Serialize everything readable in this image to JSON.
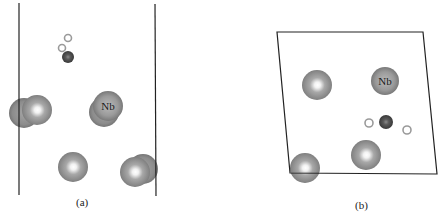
{
  "figure": {
    "panels": [
      {
        "id": "a",
        "caption": "(a)",
        "view": "side view",
        "cell_lines": [
          {
            "x1": 19,
            "y1": 3,
            "x2": 19,
            "y2": 195
          },
          {
            "x1": 155,
            "y1": 4,
            "x2": 156,
            "y2": 196
          }
        ],
        "atoms": [
          {
            "type": "large",
            "cx": 24,
            "cy": 113,
            "r": 15
          },
          {
            "type": "large",
            "cx": 37,
            "cy": 110,
            "r": 15
          },
          {
            "type": "large",
            "cx": 104,
            "cy": 112,
            "r": 15
          },
          {
            "type": "large",
            "cx": 108,
            "cy": 106,
            "r": 15,
            "label": "Nb"
          },
          {
            "type": "large",
            "cx": 73,
            "cy": 167,
            "r": 15
          },
          {
            "type": "large",
            "cx": 143,
            "cy": 169,
            "r": 15
          },
          {
            "type": "large",
            "cx": 135,
            "cy": 172,
            "r": 15
          },
          {
            "type": "small-dark",
            "cx": 68,
            "cy": 57,
            "r": 6
          },
          {
            "type": "small-ring",
            "cx": 68,
            "cy": 38,
            "r": 3.5
          },
          {
            "type": "small-ring",
            "cx": 62,
            "cy": 48,
            "r": 3.5
          }
        ]
      },
      {
        "id": "b",
        "caption": "(b)",
        "view": "top view",
        "cell_polygon": "277,32 423,32 437,174 290,173",
        "atoms": [
          {
            "type": "large",
            "cx": 317,
            "cy": 85,
            "r": 15
          },
          {
            "type": "large",
            "cx": 385,
            "cy": 81,
            "r": 14,
            "label": "Nb"
          },
          {
            "type": "large",
            "cx": 366,
            "cy": 155,
            "r": 15
          },
          {
            "type": "large",
            "cx": 305,
            "cy": 168,
            "r": 15
          },
          {
            "type": "small-dark",
            "cx": 386,
            "cy": 122,
            "r": 7
          },
          {
            "type": "small-ring",
            "cx": 369,
            "cy": 123,
            "r": 4
          },
          {
            "type": "small-ring",
            "cx": 407,
            "cy": 130,
            "r": 4
          }
        ]
      }
    ],
    "atom_label": "Nb",
    "colors": {
      "large_atom": "#8a8a8a",
      "large_atom_highlight": "#ffffff",
      "large_atom_edge": "#5e5e5e",
      "small_dark": "#4a4a4a",
      "small_ring": "#9a9a9a",
      "cell_line": "#222222"
    }
  }
}
